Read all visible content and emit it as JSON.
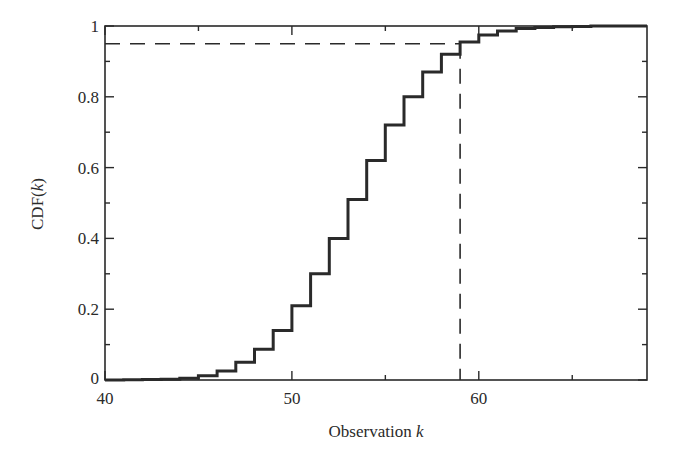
{
  "chart_data": {
    "type": "line",
    "subtype": "step",
    "title": "",
    "xlabel": "Observation k",
    "xlabel_parts": {
      "text": "Observation ",
      "var": "k"
    },
    "ylabel": "CDF(k)",
    "ylabel_parts": {
      "prefix": "CDF(",
      "var": "k",
      "suffix": ")"
    },
    "xlim": [
      40,
      69
    ],
    "ylim": [
      0,
      1
    ],
    "x_ticks": [
      40,
      50,
      60
    ],
    "x_minor_ticks": [
      45,
      55,
      65
    ],
    "x_tick_labels": [
      "40",
      "50",
      "60"
    ],
    "y_ticks": [
      0,
      0.2,
      0.4,
      0.6,
      0.8,
      1
    ],
    "y_minor_ticks": [
      0.1,
      0.3,
      0.5,
      0.7,
      0.9
    ],
    "y_tick_labels": [
      "0",
      "0.2",
      "0.4",
      "0.6",
      "0.8",
      "1"
    ],
    "grid": false,
    "legend": null,
    "series": [
      {
        "name": "CDF",
        "style": "solid step",
        "x": [
          40,
          41,
          42,
          43,
          44,
          45,
          46,
          47,
          48,
          49,
          50,
          51,
          52,
          53,
          54,
          55,
          56,
          57,
          58,
          59,
          60,
          61,
          62,
          63,
          64,
          65,
          66,
          67,
          68,
          69
        ],
        "values": [
          0.0,
          0.0005,
          0.001,
          0.002,
          0.005,
          0.012,
          0.025,
          0.05,
          0.087,
          0.14,
          0.21,
          0.3,
          0.4,
          0.51,
          0.62,
          0.72,
          0.8,
          0.87,
          0.92,
          0.955,
          0.975,
          0.986,
          0.993,
          0.996,
          0.998,
          0.999,
          1.0,
          1.0,
          1.0,
          1.0
        ]
      }
    ],
    "annotations": [
      {
        "type": "hline",
        "style": "dashed",
        "y": 0.95,
        "x_from": 40,
        "x_to": 59
      },
      {
        "type": "vline",
        "style": "dashed",
        "x": 59,
        "y_from": 0,
        "y_to": 0.95
      }
    ]
  }
}
